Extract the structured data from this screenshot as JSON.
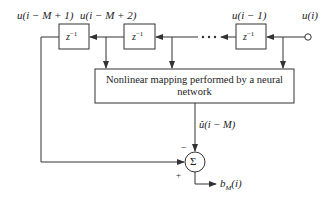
{
  "diagram": {
    "inputs": {
      "u_i": "u(i)",
      "u_i_minus_1": "u(i − 1)",
      "u_i_minus_M_plus_2": "u(i − M + 2)",
      "u_i_minus_M_plus_1": "u(i − M + 1)"
    },
    "delay_label": "z",
    "delay_exponent": "−1",
    "ellipsis": "· · ·",
    "nn_block": {
      "line1": "Nonlinear mapping performed by a neural",
      "line2": "network"
    },
    "prediction_label": "û(i − M)",
    "sum_symbol": "Σ",
    "minus_sign": "−",
    "plus_sign": "+",
    "output_label": "b",
    "output_subscript": "M",
    "output_arg": "(i)",
    "colors": {
      "line": "#333333",
      "background": "#ffffff"
    }
  }
}
